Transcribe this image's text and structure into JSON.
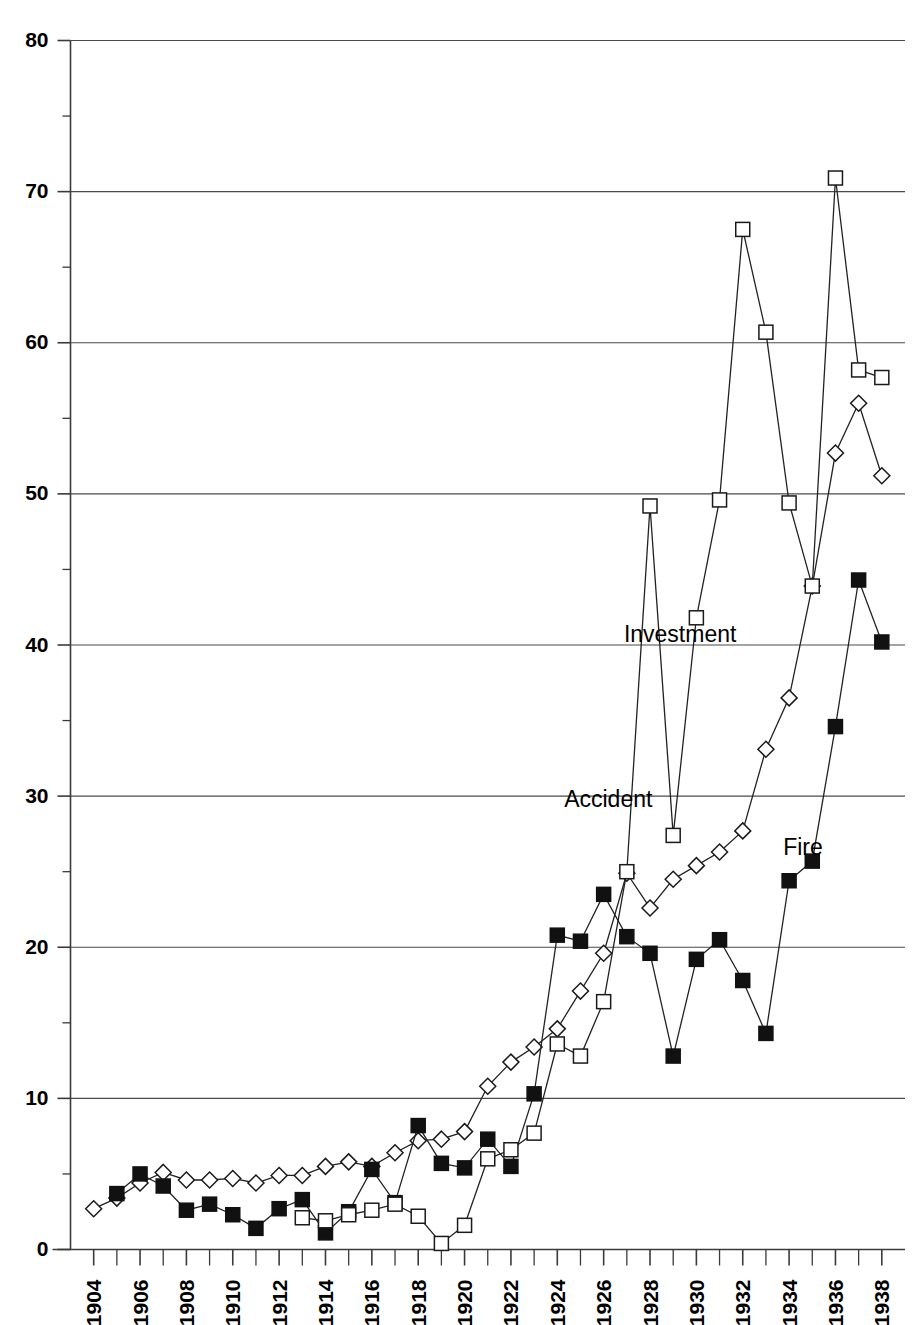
{
  "chart_data": {
    "type": "line",
    "title": "",
    "subtitle": "",
    "xlabel": "",
    "ylabel": "",
    "xlim": [
      1903,
      1939
    ],
    "ylim": [
      0,
      80
    ],
    "grid": true,
    "grid_axis": "y",
    "legend_position": "inline-annotations",
    "x_tick_labels": [
      "1904",
      "1906",
      "1908",
      "1910",
      "1912",
      "1914",
      "1916",
      "1918",
      "1920",
      "1922",
      "1924",
      "1926",
      "1928",
      "1930",
      "1932",
      "1934",
      "1936",
      "1938"
    ],
    "x_tick_values": [
      1904,
      1906,
      1908,
      1910,
      1912,
      1914,
      1916,
      1918,
      1920,
      1922,
      1924,
      1926,
      1928,
      1930,
      1932,
      1934,
      1936,
      1938
    ],
    "x_minor_tick_values": [
      1905,
      1907,
      1909,
      1911,
      1913,
      1915,
      1917,
      1919,
      1921,
      1923,
      1925,
      1927,
      1929,
      1931,
      1933,
      1935,
      1937
    ],
    "y_tick_labels": [
      "0",
      "10",
      "20",
      "30",
      "40",
      "50",
      "60",
      "70",
      "80"
    ],
    "y_tick_values": [
      0,
      10,
      20,
      30,
      40,
      50,
      60,
      70,
      80
    ],
    "y_minor_tick_values": [
      5,
      15,
      25,
      35,
      45,
      55,
      65,
      75
    ],
    "x": [
      1904,
      1905,
      1906,
      1907,
      1908,
      1909,
      1910,
      1911,
      1912,
      1913,
      1914,
      1915,
      1916,
      1917,
      1918,
      1919,
      1920,
      1921,
      1922,
      1923,
      1924,
      1925,
      1926,
      1927,
      1928,
      1929,
      1930,
      1931,
      1932,
      1933,
      1934,
      1935,
      1936,
      1937,
      1938
    ],
    "series": [
      {
        "name": "Accident",
        "marker": "open-diamond",
        "color": "#111111",
        "annotation_label": "Accident",
        "x": [
          1904,
          1905,
          1906,
          1907,
          1908,
          1909,
          1910,
          1911,
          1912,
          1913,
          1914,
          1915,
          1916,
          1917,
          1918,
          1919,
          1920,
          1921,
          1922,
          1923,
          1924,
          1925,
          1926,
          1927,
          1928,
          1929,
          1930,
          1931,
          1932,
          1933,
          1934,
          1935,
          1936,
          1937,
          1938
        ],
        "values": [
          2.7,
          3.4,
          4.4,
          5.1,
          4.6,
          4.6,
          4.7,
          4.4,
          4.9,
          4.9,
          5.5,
          5.8,
          5.5,
          6.4,
          7.2,
          7.3,
          7.8,
          10.8,
          12.4,
          13.4,
          14.6,
          17.1,
          19.6,
          24.9,
          22.6,
          24.5,
          25.4,
          26.3,
          27.7,
          33.1,
          36.5,
          43.9,
          52.7,
          56.0,
          51.2
        ]
      },
      {
        "name": "Fire",
        "marker": "filled-square",
        "color": "#111111",
        "annotation_label": "Fire",
        "x": [
          1905,
          1906,
          1907,
          1908,
          1909,
          1910,
          1911,
          1912,
          1913,
          1914,
          1915,
          1916,
          1917,
          1918,
          1919,
          1920,
          1921,
          1922,
          1923,
          1924,
          1925,
          1926,
          1927,
          1928,
          1929,
          1930,
          1931,
          1932,
          1933,
          1934,
          1935,
          1936,
          1937,
          1938
        ],
        "values": [
          3.7,
          5.0,
          4.2,
          2.6,
          3.0,
          2.3,
          1.4,
          2.7,
          3.3,
          1.1,
          2.5,
          5.3,
          3.1,
          8.2,
          5.7,
          5.4,
          7.3,
          5.5,
          10.3,
          20.8,
          20.4,
          23.5,
          20.7,
          19.6,
          12.8,
          19.2,
          20.5,
          17.8,
          14.3,
          24.4,
          25.7,
          34.6,
          44.3,
          40.2
        ]
      },
      {
        "name": "Investment",
        "marker": "open-square",
        "color": "#111111",
        "annotation_label": "Investment",
        "x": [
          1913,
          1914,
          1915,
          1916,
          1917,
          1918,
          1919,
          1920,
          1921,
          1922,
          1923,
          1924,
          1925,
          1926,
          1927,
          1928,
          1929,
          1930,
          1931,
          1932,
          1933,
          1934,
          1935,
          1936,
          1937,
          1938
        ],
        "values": [
          2.1,
          1.9,
          2.3,
          2.6,
          3.0,
          2.2,
          0.4,
          1.6,
          6.0,
          6.6,
          7.7,
          13.6,
          12.8,
          16.4,
          25.0,
          49.2,
          27.4,
          41.8,
          49.6,
          67.5,
          60.7,
          49.4,
          43.9,
          70.9,
          58.2,
          57.7
        ]
      }
    ],
    "annotations": [
      {
        "text": "Investment",
        "x": 1929.3,
        "y": 40.2
      },
      {
        "text": "Accident",
        "x": 1926.2,
        "y": 29.3
      },
      {
        "text": "Fire",
        "x": 1934.6,
        "y": 26.1
      }
    ]
  }
}
